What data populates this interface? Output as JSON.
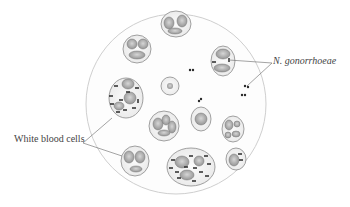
{
  "figure": {
    "labels": {
      "bacteria": "N. gonorrhoeae",
      "wbc": "White blood cells"
    },
    "colors": {
      "field_border": "#c8c8c8",
      "cell_outline": "#8a8a8a",
      "nucleus_fill": "#b0b0b0",
      "diplococci": "#2a2a2a",
      "leader_line": "#666666",
      "label_text": "#444444"
    },
    "field": {
      "cx": 176,
      "cy": 104,
      "r": 90
    }
  }
}
